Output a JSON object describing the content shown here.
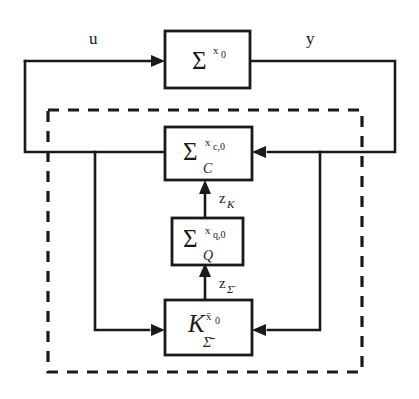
{
  "diagram": {
    "background_color": "#ffffff",
    "line_color": "#1a1a1a",
    "blocks": [
      {
        "id": "plant",
        "symbol": "Σ",
        "superscript": "x₀",
        "subscript": "",
        "name": "plant-block"
      },
      {
        "id": "controller",
        "symbol": "Σ",
        "superscript": "x",
        "superscript_sub": "c,0",
        "subscript": "C",
        "name": "controller-block"
      },
      {
        "id": "observer",
        "symbol": "Σ",
        "superscript": "x",
        "superscript_sub": "q,0",
        "subscript": "Q",
        "name": "observer-block"
      },
      {
        "id": "gain",
        "symbol": "K",
        "superscript": "x̄₀",
        "subscript": "Σ̄",
        "name": "gain-block"
      }
    ],
    "signals": [
      {
        "id": "u",
        "label": "u",
        "name": "input-signal-u"
      },
      {
        "id": "y",
        "label": "y",
        "name": "output-signal-y"
      },
      {
        "id": "zK",
        "label": "z",
        "sub": "K",
        "name": "signal-z-k"
      },
      {
        "id": "zSigma",
        "label": "z",
        "sub": "Σ̄",
        "name": "signal-z-sigma-bar"
      }
    ],
    "enclosure": {
      "style": "dashed",
      "name": "dashed-enclosure"
    }
  }
}
